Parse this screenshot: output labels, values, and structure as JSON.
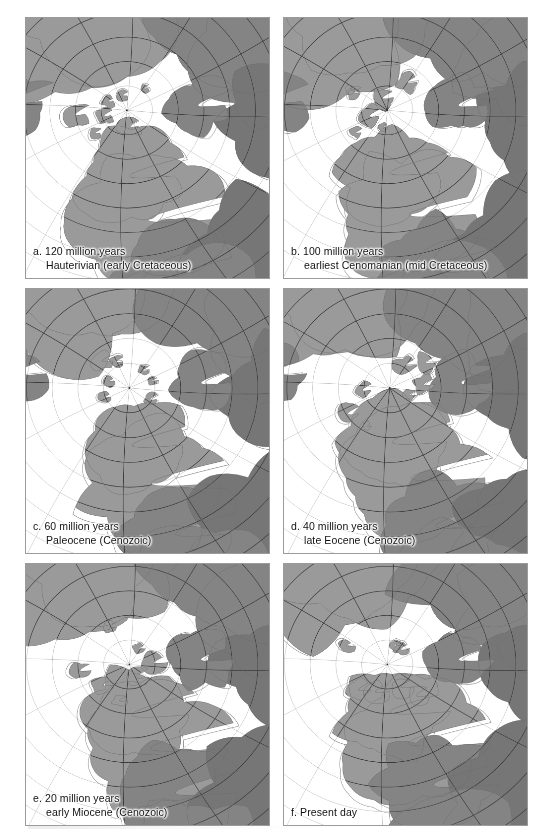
{
  "figure": {
    "kind": "paleogeographic-map-series",
    "region": "North America and Arctic, polar projection",
    "columns": 2,
    "rows": 3,
    "panel_count": 6,
    "colors": {
      "land": "#9a9a9a",
      "land_dark": "#848484",
      "land_darker": "#767676",
      "ocean": "#ffffff",
      "shelf_outline": "#8e8e8e",
      "graticule_map": "#3a3a3a",
      "graticule_ocean": "#a7a7a7",
      "panel_border": "#9b9b9b",
      "caption_text": "#111111",
      "background": "#ffffff"
    }
  },
  "panels": [
    {
      "id": "panel-a",
      "letter": "a.",
      "age_label": "120 million years",
      "stage_label": "Hauterivian (early Cretaceous)",
      "caption_line1": "a. 120 million years",
      "caption_line2": "Hauterivian (early Cretaceous)",
      "million_years": 120,
      "era": "early Cretaceous",
      "stage": "Hauterivian",
      "pole_x": 0.415,
      "pole_y": 0.355,
      "meridian_count": 12,
      "parallel_count": 5,
      "land_seed": 11
    },
    {
      "id": "panel-b",
      "letter": "b.",
      "age_label": "100 million years",
      "stage_label": "earliest Cenomanian (mid Cretaceous)",
      "caption_line1": "b. 100 million years",
      "caption_line2": "earliest Cenomanian (mid Cretaceous)",
      "million_years": 100,
      "era": "mid Cretaceous",
      "stage": "earliest Cenomanian",
      "pole_x": 0.425,
      "pole_y": 0.355,
      "meridian_count": 12,
      "parallel_count": 5,
      "land_seed": 23
    },
    {
      "id": "panel-c",
      "letter": "c.",
      "age_label": "60 million years",
      "stage_label": "Paleocene (Cenozoic)",
      "caption_line1": "c. 60 million years",
      "caption_line2": "Paleocene (Cenozoic)",
      "million_years": 60,
      "era": "Cenozoic",
      "stage": "Paleocene",
      "pole_x": 0.425,
      "pole_y": 0.375,
      "meridian_count": 12,
      "parallel_count": 5,
      "land_seed": 37
    },
    {
      "id": "panel-d",
      "letter": "d.",
      "age_label": "40 million years",
      "stage_label": "late Eocene (Cenozoic)",
      "caption_line1": "d. 40 million years",
      "caption_line2": "late Eocene (Cenozoic)",
      "million_years": 40,
      "era": "Cenozoic",
      "stage": "late Eocene",
      "pole_x": 0.435,
      "pole_y": 0.375,
      "meridian_count": 12,
      "parallel_count": 5,
      "land_seed": 53
    },
    {
      "id": "panel-e",
      "letter": "e.",
      "age_label": "20 million years",
      "stage_label": "early Miocene (Cenozoic)",
      "caption_line1": "e. 20 million years",
      "caption_line2": "early Miocene (Cenozoic)",
      "million_years": 20,
      "era": "Cenozoic",
      "stage": "early Miocene",
      "pole_x": 0.425,
      "pole_y": 0.385,
      "meridian_count": 12,
      "parallel_count": 5,
      "land_seed": 67
    },
    {
      "id": "panel-f",
      "letter": "f.",
      "age_label": "Present day",
      "stage_label": "",
      "caption_line1": "f. Present day",
      "caption_line2": "",
      "million_years": 0,
      "era": "Present",
      "stage": "Present day",
      "pole_x": 0.425,
      "pole_y": 0.385,
      "meridian_count": 12,
      "parallel_count": 5,
      "land_seed": 89
    }
  ]
}
